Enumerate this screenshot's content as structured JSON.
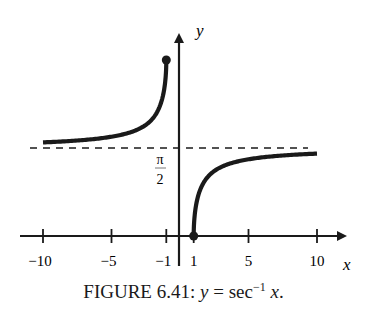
{
  "chart_data": {
    "type": "line",
    "function": "y = arcsec(x)",
    "xlabel": "x",
    "ylabel": "y",
    "xlim": [
      -11.5,
      12.5
    ],
    "ylim": [
      0,
      3.3
    ],
    "x_ticks": [
      -10,
      -5,
      -1,
      1,
      5,
      10
    ],
    "x_tick_labels": [
      "−10",
      "−5",
      "−1",
      "1",
      "5",
      "10"
    ],
    "y_tick_labels": [
      "π/2"
    ],
    "asymptote": {
      "y": 1.5708,
      "label": "π/2",
      "style": "dashed"
    },
    "series": [
      {
        "name": "left branch",
        "domain": [
          -10,
          -1
        ],
        "endpoint": {
          "x": -1,
          "y": 3.1416,
          "marker": "closed"
        },
        "points": [
          [
            -10,
            1.671
          ],
          [
            -5,
            1.7722
          ],
          [
            -3,
            1.9106
          ],
          [
            -2,
            2.0944
          ],
          [
            -1.5,
            2.3005
          ],
          [
            -1.2,
            2.5559
          ],
          [
            -1.05,
            2.8282
          ],
          [
            -1,
            3.1416
          ]
        ]
      },
      {
        "name": "right branch",
        "domain": [
          1,
          10
        ],
        "endpoint": {
          "x": 1,
          "y": 0,
          "marker": "closed"
        },
        "points": [
          [
            1,
            0
          ],
          [
            1.05,
            0.3134
          ],
          [
            1.2,
            0.5857
          ],
          [
            1.5,
            0.8411
          ],
          [
            2,
            1.0472
          ],
          [
            3,
            1.231
          ],
          [
            5,
            1.3694
          ],
          [
            10,
            1.4706
          ]
        ]
      }
    ],
    "grid": false
  },
  "caption": {
    "prefix": "FIGURE 6.41: ",
    "y": "y",
    "eq": " = sec",
    "sup": "−1",
    "x": " x",
    "end": "."
  },
  "axes": {
    "x_label": "x",
    "y_label": "y",
    "pi_label": "π",
    "two_label": "2"
  }
}
